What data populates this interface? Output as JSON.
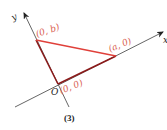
{
  "diagram": {
    "caption": "(3)",
    "axes": {
      "x_label": "x",
      "y_label": "y",
      "origin_label": "O"
    },
    "points": [
      {
        "id": "origin",
        "label": "(0, 0)"
      },
      {
        "id": "a",
        "label": "(a, 0)"
      },
      {
        "id": "b",
        "label": "(0, b)"
      }
    ],
    "colors": {
      "axis": "#555555",
      "hypotenuse": "#e0403a",
      "legs": "#8b1a1a",
      "labels": "#d9604f",
      "text": "#222222"
    }
  }
}
